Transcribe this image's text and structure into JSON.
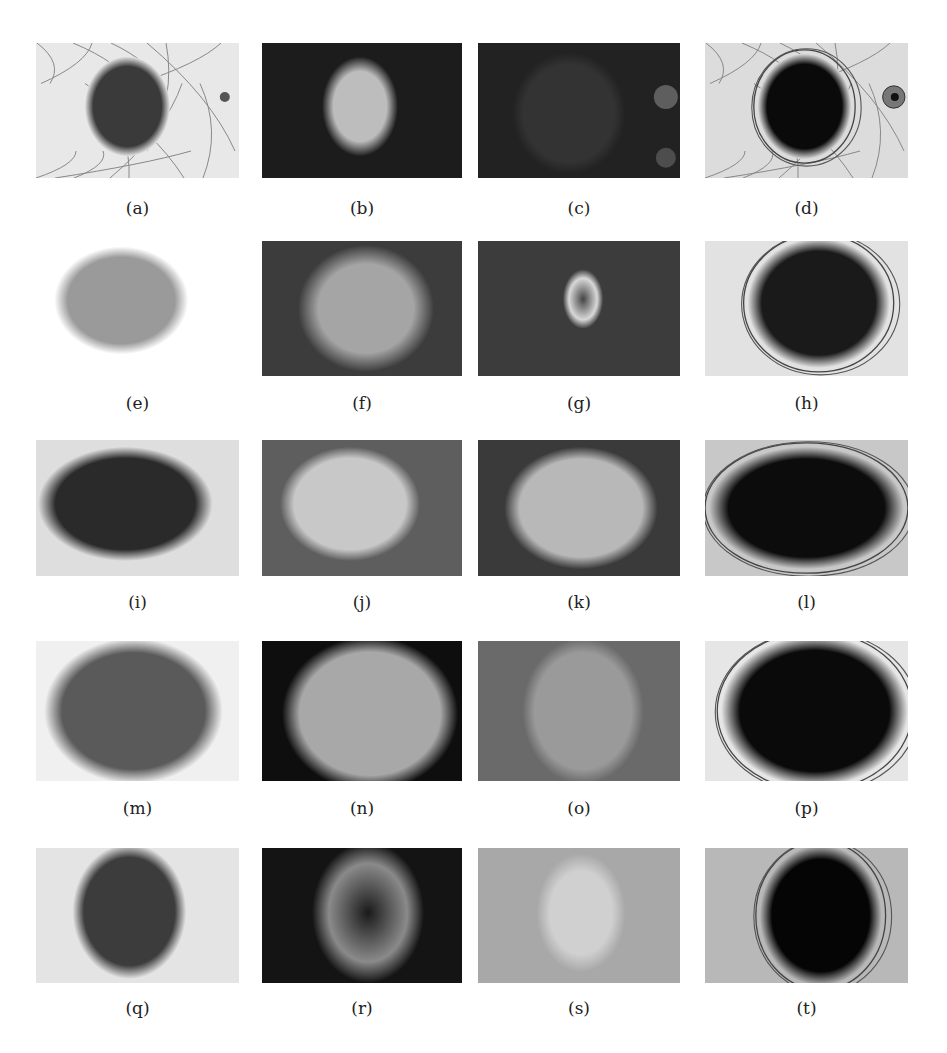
{
  "figure": {
    "layout": {
      "rows": 5,
      "columns": 4
    },
    "panels": [
      {
        "id": "a",
        "caption": "(a)",
        "kind": "original",
        "bg": "#e8e8e8",
        "lesion": "#3a3a3a"
      },
      {
        "id": "b",
        "caption": "(b)",
        "kind": "channel",
        "bg": "#1c1c1c",
        "lesion": "#bdbdbd"
      },
      {
        "id": "c",
        "caption": "(c)",
        "kind": "channel",
        "bg": "#222222",
        "lesion": "#333333"
      },
      {
        "id": "d",
        "caption": "(d)",
        "kind": "segmentation",
        "bg": "#dcdcdc",
        "lesion": "#0a0a0a"
      },
      {
        "id": "e",
        "caption": "(e)",
        "kind": "original",
        "bg": "#ffffff",
        "lesion": "#9a9a9a"
      },
      {
        "id": "f",
        "caption": "(f)",
        "kind": "channel",
        "bg": "#3c3c3c",
        "lesion": "#a5a5a5"
      },
      {
        "id": "g",
        "caption": "(g)",
        "kind": "channel",
        "bg": "#3c3c3c",
        "lesion": "#d8d8d8"
      },
      {
        "id": "h",
        "caption": "(h)",
        "kind": "segmentation",
        "bg": "#e2e2e2",
        "lesion": "#1a1a1a"
      },
      {
        "id": "i",
        "caption": "(i)",
        "kind": "original",
        "bg": "#dedede",
        "lesion": "#2a2a2a"
      },
      {
        "id": "j",
        "caption": "(j)",
        "kind": "channel",
        "bg": "#5e5e5e",
        "lesion": "#c8c8c8"
      },
      {
        "id": "k",
        "caption": "(k)",
        "kind": "channel",
        "bg": "#3a3a3a",
        "lesion": "#b8b8b8"
      },
      {
        "id": "l",
        "caption": "(l)",
        "kind": "segmentation",
        "bg": "#c8c8c8",
        "lesion": "#0c0c0c"
      },
      {
        "id": "m",
        "caption": "(m)",
        "kind": "original",
        "bg": "#f0f0f0",
        "lesion": "#5a5a5a"
      },
      {
        "id": "n",
        "caption": "(n)",
        "kind": "channel",
        "bg": "#0e0e0e",
        "lesion": "#a8a8a8"
      },
      {
        "id": "o",
        "caption": "(o)",
        "kind": "channel",
        "bg": "#6a6a6a",
        "lesion": "#9a9a9a"
      },
      {
        "id": "p",
        "caption": "(p)",
        "kind": "segmentation",
        "bg": "#e6e6e6",
        "lesion": "#0a0a0a"
      },
      {
        "id": "q",
        "caption": "(q)",
        "kind": "original",
        "bg": "#e4e4e4",
        "lesion": "#3c3c3c"
      },
      {
        "id": "r",
        "caption": "(r)",
        "kind": "channel",
        "bg": "#141414",
        "lesion": "#8a8a8a"
      },
      {
        "id": "s",
        "caption": "(s)",
        "kind": "channel",
        "bg": "#a8a8a8",
        "lesion": "#d0d0d0"
      },
      {
        "id": "t",
        "caption": "(t)",
        "kind": "segmentation",
        "bg": "#b8b8b8",
        "lesion": "#050505"
      }
    ]
  }
}
